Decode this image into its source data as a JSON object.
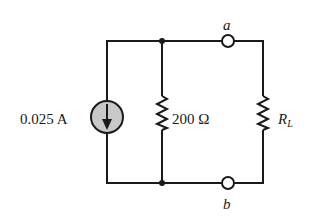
{
  "diagram": {
    "type": "circuit",
    "source": {
      "kind": "current-source",
      "value": "0.025 A",
      "direction": "down"
    },
    "resistor_parallel": {
      "value": "200 Ω"
    },
    "load": {
      "label_main": "R",
      "label_sub": "L"
    },
    "terminals": {
      "top": "a",
      "bottom": "b"
    },
    "colors": {
      "wire": "#1a1a1a",
      "source_fill": "#c8c8c8",
      "background": "#ffffff"
    }
  }
}
